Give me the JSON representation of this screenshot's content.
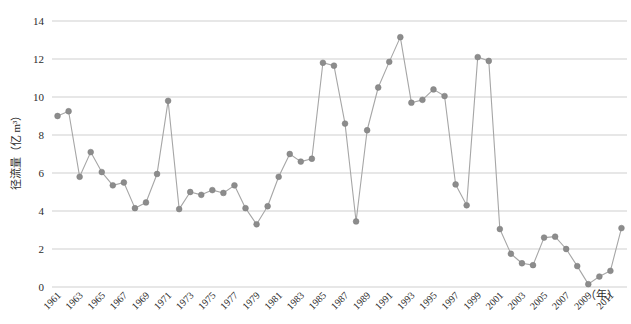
{
  "chart_data": {
    "type": "line",
    "title": "",
    "subtitle": "",
    "xlabel": "（年）",
    "ylabel": "径流量（亿 m³）",
    "xlim": [
      1960.5,
      2012.5
    ],
    "ylim": [
      0,
      14
    ],
    "ytick_values": [
      0,
      2,
      4,
      6,
      8,
      10,
      12,
      14
    ],
    "ytick_labels": [
      "0",
      "2",
      "4",
      "6",
      "8",
      "10",
      "12",
      "14"
    ],
    "xtick_labels": [
      "1961",
      "1963",
      "1965",
      "1967",
      "1969",
      "1971",
      "1973",
      "1975",
      "1977",
      "1979",
      "1981",
      "1983",
      "1985",
      "1987",
      "1989",
      "1991",
      "1993",
      "1995",
      "1997",
      "1999",
      "2001",
      "2003",
      "2005",
      "2007",
      "2009",
      "2011"
    ],
    "grid": true,
    "grid_axis": "y",
    "legend": false,
    "legend_position": "none",
    "marker": "circle",
    "marker_color": "#8c8c8c",
    "line_color": "#a6a6a6",
    "grid_color": "#c9c9c9",
    "x": [
      1961,
      1962,
      1963,
      1964,
      1965,
      1966,
      1967,
      1968,
      1969,
      1970,
      1971,
      1972,
      1973,
      1974,
      1975,
      1976,
      1977,
      1978,
      1979,
      1980,
      1981,
      1982,
      1983,
      1984,
      1985,
      1986,
      1987,
      1988,
      1989,
      1990,
      1991,
      1992,
      1993,
      1994,
      1995,
      1996,
      1997,
      1998,
      1999,
      2000,
      2001,
      2002,
      2003,
      2004,
      2005,
      2006,
      2007,
      2008,
      2009,
      2010,
      2011,
      2012
    ],
    "series": [
      {
        "name": "径流量",
        "values": [
          9.0,
          9.25,
          5.8,
          7.1,
          6.05,
          5.35,
          5.5,
          4.15,
          4.45,
          5.95,
          9.8,
          4.1,
          5.0,
          4.85,
          5.1,
          4.95,
          5.35,
          4.15,
          3.3,
          4.25,
          5.8,
          7.0,
          6.6,
          6.75,
          11.8,
          11.65,
          8.6,
          3.45,
          8.25,
          10.5,
          11.85,
          13.15,
          9.7,
          9.85,
          10.4,
          10.05,
          5.4,
          4.3,
          12.1,
          11.9,
          3.05,
          1.75,
          1.25,
          1.15,
          2.6,
          2.65,
          2.0,
          1.1,
          0.15,
          0.55,
          0.85,
          3.1
        ]
      }
    ]
  }
}
